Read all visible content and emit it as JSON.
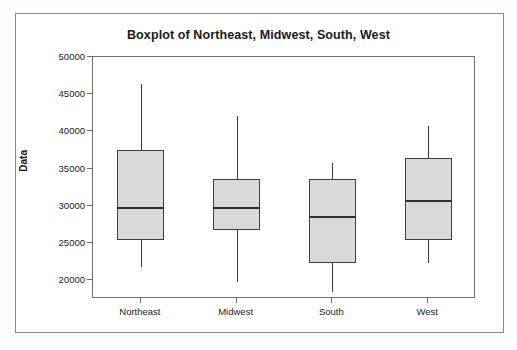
{
  "chart_data": {
    "type": "box",
    "title": "Boxplot of Northeast, Midwest, South, West",
    "xlabel": "",
    "ylabel": "Data",
    "categories": [
      "Northeast",
      "Midwest",
      "South",
      "West"
    ],
    "ylim": [
      17500,
      50000
    ],
    "yticks": [
      20000,
      25000,
      30000,
      35000,
      40000,
      45000,
      50000
    ],
    "ytick_labels": [
      "20000",
      "25000",
      "30000",
      "35000",
      "40000",
      "45000",
      "50000"
    ],
    "grid": false,
    "legend": "none",
    "box_fill_color": "#d9d9d9",
    "box_edge_color": "#3d3d3d",
    "boxes": [
      {
        "name": "Northeast",
        "min": 21800,
        "q1": 25400,
        "median": 29700,
        "q3": 37500,
        "max": 46400
      },
      {
        "name": "Midwest",
        "min": 19800,
        "q1": 26800,
        "median": 29700,
        "q3": 33600,
        "max": 42100
      },
      {
        "name": "South",
        "min": 18500,
        "q1": 22400,
        "median": 28500,
        "q3": 33600,
        "max": 35800
      },
      {
        "name": "West",
        "min": 22400,
        "q1": 25400,
        "median": 30600,
        "q3": 36500,
        "max": 40700
      }
    ]
  }
}
